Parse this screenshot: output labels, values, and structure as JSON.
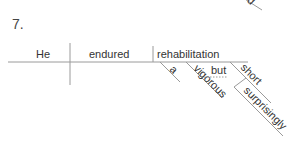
{
  "problem_number": "7.",
  "partial_previous_word": "d",
  "sentence_diagram": {
    "subject": "He",
    "verb": "endured",
    "direct_object": "rehabilitation",
    "modifiers": {
      "article": "a",
      "adjective_1": "vigorous",
      "conjunction": "but",
      "adjective_2": "short",
      "adverb": "surprisingly"
    }
  },
  "colors": {
    "line": "#9a9a9a",
    "text": "#333333"
  }
}
